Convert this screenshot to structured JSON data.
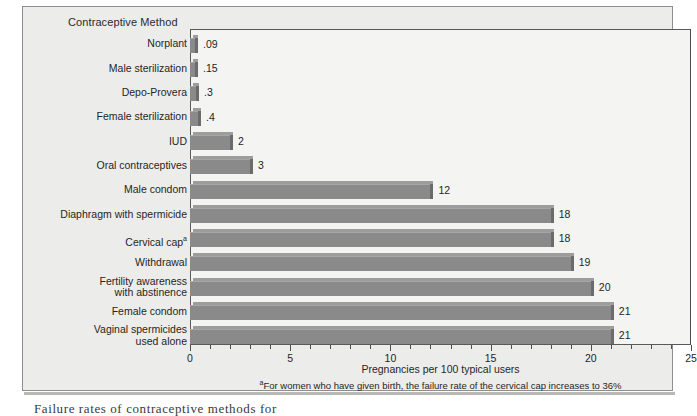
{
  "figure": {
    "chart_title": "Contraceptive Method",
    "x_axis_title": "Pregnancies per 100 typical users",
    "footnote_marker": "a",
    "footnote_text": "For women who have given birth, the failure rate of the cervical cap increases to 36%",
    "clipped_caption": "Failure rates of contraceptive methods for"
  },
  "colors": {
    "panel_background": "#ececea",
    "plot_background": "#f4f4f2",
    "bar_body": "#8a8a8a",
    "bar_top": "#9d9d9d",
    "bar_cap": "#6b6b6b",
    "axis": "#4f4f4f",
    "text": "#1f1f1f"
  },
  "chart_data": {
    "type": "bar",
    "orientation": "horizontal",
    "title": "Contraceptive Method",
    "xlabel": "Pregnancies per 100 typical users",
    "ylabel": "Contraceptive Method",
    "xlim": [
      0,
      25
    ],
    "xticks": [
      0,
      5,
      10,
      15,
      20,
      25
    ],
    "xtick_labels": [
      "0",
      "5",
      "10",
      "15",
      "20",
      "25"
    ],
    "minor_tick_interval": 1,
    "grid": false,
    "legend": false,
    "categories": [
      "Norplant",
      "Male sterilization",
      "Depo-Provera",
      "Female sterilization",
      "IUD",
      "Oral contraceptives",
      "Male condom",
      "Diaphragm with spermicide",
      "Cervical cap",
      "Withdrawal",
      "Fertility awareness\nwith abstinence",
      "Female condom",
      "Vaginal spermicides\nused alone"
    ],
    "values": [
      0.09,
      0.15,
      0.3,
      0.4,
      2,
      3,
      12,
      18,
      18,
      19,
      20,
      21,
      21
    ],
    "value_labels": [
      ".09",
      ".15",
      ".3",
      ".4",
      "2",
      "3",
      "12",
      "18",
      "18",
      "19",
      "20",
      "21",
      "21"
    ],
    "footnote_categories": [
      "Cervical cap"
    ]
  }
}
